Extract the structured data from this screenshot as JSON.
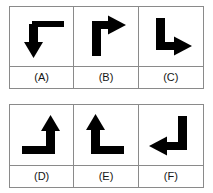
{
  "figure": {
    "type": "answer-options-grid",
    "stroke_color": "#000000",
    "border_color": "#8a8a8a",
    "background_color": "#ffffff",
    "rows": [
      {
        "cells": [
          {
            "label": "(A)",
            "icon": "elbow-arrow-down-from-right",
            "arrow_description": "horizontal segment along the top running to the right, corner at upper-left, shaft turning downward, arrowhead pointing down",
            "arrow_direction": "down"
          },
          {
            "label": "(B)",
            "icon": "elbow-arrow-right-from-bottom",
            "arrow_description": "vertical segment rising from the bottom, corner at upper-left, shaft turning to the right, arrowhead pointing right",
            "arrow_direction": "right"
          },
          {
            "label": "(C)",
            "icon": "elbow-arrow-right-from-top",
            "arrow_description": "vertical segment descending from the top, corner at lower-left, shaft turning to the right, arrowhead pointing right",
            "arrow_direction": "right"
          }
        ]
      },
      {
        "cells": [
          {
            "label": "(D)",
            "icon": "elbow-arrow-up-from-left",
            "arrow_description": "horizontal segment along the bottom running from the left, corner at lower-right, shaft turning upward, arrowhead pointing up",
            "arrow_direction": "up"
          },
          {
            "label": "(E)",
            "icon": "elbow-arrow-up-from-right",
            "arrow_description": "horizontal segment along the bottom running from the right, corner at lower-left, shaft turning upward, arrowhead pointing up",
            "arrow_direction": "up"
          },
          {
            "label": "(F)",
            "icon": "elbow-arrow-left-from-top",
            "arrow_description": "vertical segment descending from the top, corner at lower-right, shaft turning to the left, arrowhead pointing left",
            "arrow_direction": "left"
          }
        ]
      }
    ]
  }
}
